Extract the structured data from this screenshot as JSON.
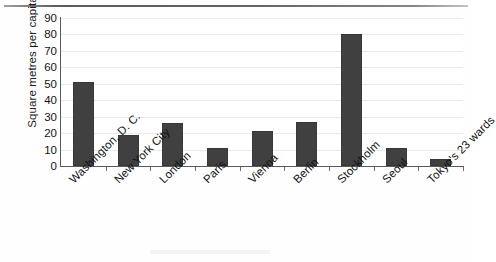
{
  "chart_data": {
    "type": "bar",
    "title": "",
    "xlabel": "",
    "ylabel": "Square metres per capita",
    "ylim": [
      0,
      90
    ],
    "yticks": [
      0,
      10,
      20,
      30,
      40,
      50,
      60,
      70,
      80,
      90
    ],
    "grid": true,
    "legend": "none",
    "orientation": "vertical",
    "bar_color": "#404040",
    "categories": [
      "Washington, D. C.",
      "New York City",
      "London",
      "Paris",
      "Vienna",
      "Berlin",
      "Stockholm",
      "Seoul",
      "Tokyo's 23 wards"
    ],
    "values": [
      51,
      19,
      26,
      11,
      21,
      27,
      80,
      11,
      4
    ],
    "series": [
      {
        "name": "Square metres per capita",
        "values": [
          51,
          19,
          26,
          11,
          21,
          27,
          80,
          11,
          4
        ]
      }
    ]
  }
}
